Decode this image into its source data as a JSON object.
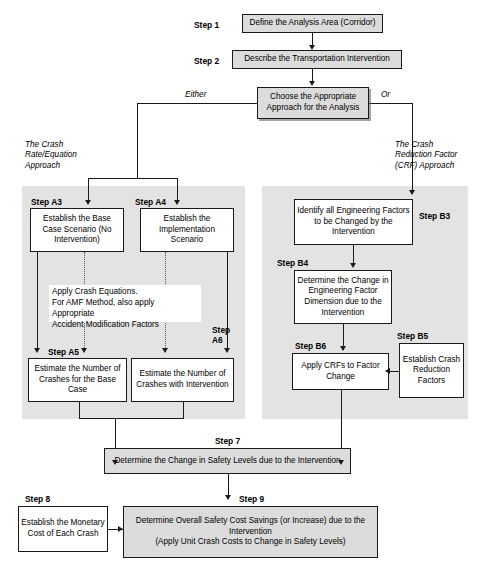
{
  "diagram": {
    "colors": {
      "panel_fill": "#e3e3e3",
      "box_shaded_fill": "#dcdcdc",
      "box_fill": "#ffffff",
      "line": "#1a1a1a",
      "background": "#ffffff"
    }
  },
  "steps": {
    "step1": {
      "label": "Step 1",
      "text": "Define the Analysis Area (Corridor)"
    },
    "step2": {
      "label": "Step 2",
      "text": "Describe the Transportation Intervention"
    },
    "choose": {
      "text": "Choose the Appropriate Approach for the Analysis"
    },
    "stepA3": {
      "label": "Step A3",
      "text": "Establish the Base Case Scenario (No Intervention)"
    },
    "stepA4": {
      "label": "Step A4",
      "text": "Establish the Implementation Scenario"
    },
    "stepA5": {
      "label": "Step A5",
      "text": "Estimate the Number of Crashes for the Base Case"
    },
    "stepA6": {
      "label": "Step\nA6",
      "text": "Estimate the Number of Crashes with Intervention"
    },
    "stepB3": {
      "label": "Step B3",
      "text": "Identify all Engineering Factors to be Changed by the Intervention"
    },
    "stepB4": {
      "label": "Step B4",
      "text": "Determine the Change in Engineering Factor Dimension due to the Intervention"
    },
    "stepB5": {
      "label": "Step B5",
      "text": "Establish Crash Reduction Factors"
    },
    "stepB6": {
      "label": "Step B6",
      "text": "Apply CRFs to Factor Change"
    },
    "step7": {
      "label": "Step 7",
      "text": "Determine the Change in Safety Levels due to the Intervention"
    },
    "step8": {
      "label": "Step 8",
      "text": "Establish the Monetary Cost of Each Crash"
    },
    "step9": {
      "label": "Step 9",
      "text_line1": "Determine Overall Safety Cost Savings (or Increase) due to the Intervention",
      "text_line2": "(Apply Unit Crash Costs to Change in Safety Levels)"
    }
  },
  "branches": {
    "either": "Either",
    "or": "Or",
    "left_approach": "The Crash\nRate/Equation\nApproach",
    "right_approach": "The Crash\nReduction Factor\n(CRF) Approach"
  },
  "notes": {
    "crash_equations": "Apply Crash Equations.\nFor AMF Method, also apply Appropriate\nAccident Modification Factors"
  }
}
